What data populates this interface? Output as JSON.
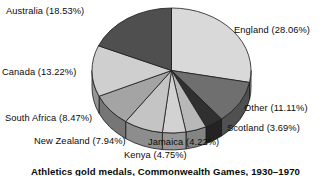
{
  "chart_data": {
    "type": "pie",
    "title": "Athletics gold medals, Commonwealth Games, 1930–1970",
    "categories": [
      "England",
      "Other",
      "Scotland",
      "Jamaica",
      "Kenya",
      "New Zealand",
      "South Africa",
      "Canada",
      "Australia"
    ],
    "values": [
      28.06,
      11.11,
      3.69,
      4.22,
      4.75,
      7.94,
      8.47,
      13.22,
      18.53
    ],
    "value_unit": "%",
    "legend": "none",
    "labels_position": "outside",
    "three_d": true,
    "slice_colors": [
      "#d9d9d9",
      "#6f6f6f",
      "#303030",
      "#b8b8b8",
      "#d2d2d2",
      "#c4c4c4",
      "#a4a4a4",
      "#cfcfcf",
      "#4f4f4f"
    ],
    "slices": [
      {
        "name": "England",
        "value": 28.06,
        "label": "England (28.06%)",
        "color": "#d9d9d9"
      },
      {
        "name": "Other",
        "value": 11.11,
        "label": "Other (11.11%)",
        "color": "#6f6f6f"
      },
      {
        "name": "Scotland",
        "value": 3.69,
        "label": "Scotland (3.69%)",
        "color": "#303030"
      },
      {
        "name": "Jamaica",
        "value": 4.22,
        "label": "Jamaica (4.22%)",
        "color": "#b8b8b8"
      },
      {
        "name": "Kenya",
        "value": 4.75,
        "label": "Kenya (4.75%)",
        "color": "#d2d2d2"
      },
      {
        "name": "New Zealand",
        "value": 7.94,
        "label": "New Zealand (7.94%)",
        "color": "#c4c4c4"
      },
      {
        "name": "South Africa",
        "value": 8.47,
        "label": "South Africa (8.47%)",
        "color": "#a4a4a4"
      },
      {
        "name": "Canada",
        "value": 13.22,
        "label": "Canada (13.22%)",
        "color": "#cfcfcf"
      },
      {
        "name": "Australia",
        "value": 18.53,
        "label": "Australia (18.53%)",
        "color": "#4f4f4f"
      }
    ]
  },
  "labels": {
    "australia": "Australia (18.53%)",
    "england": "England (28.06%)",
    "canada": "Canada (13.22%)",
    "other": "Other (11.11%)",
    "south_africa": "South Africa (8.47%)",
    "scotland": "Scotland (3.69%)",
    "new_zealand": "New Zealand (7.94%)",
    "jamaica": "Jamaica (4.22%)",
    "kenya": "Kenya (4.75%)"
  },
  "caption": {
    "text": "Athletics gold medals, Commonwealth Games, 1930–1970"
  }
}
